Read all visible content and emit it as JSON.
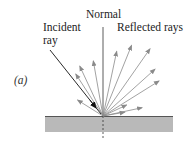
{
  "figure": {
    "panel_label": "(a)",
    "labels": {
      "normal": "Normal",
      "incident_line1": "Incident",
      "incident_line2": "ray",
      "reflected": "Reflected rays"
    },
    "colors": {
      "surface_fill": "#b9b9b9",
      "surface_edge": "#555555",
      "incident_ray": "#1a1a1a",
      "reflected_ray": "#8a8a8a",
      "normal_line": "#333333",
      "text": "#222222"
    },
    "reflected_ray_count": 12,
    "reflected_ray_angles_deg_from_normal": [
      -58,
      -33,
      -25,
      -10,
      12,
      22,
      35,
      48,
      58,
      65,
      78,
      80
    ]
  }
}
